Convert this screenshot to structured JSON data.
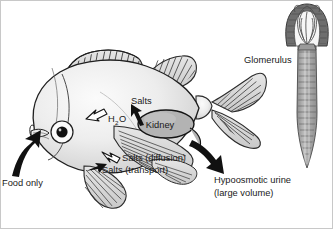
{
  "figure": {
    "background_color": "#ffffff",
    "border_color": "#b4b4b4",
    "ink_color": "#1a1a1a"
  },
  "labels": {
    "food_only": "Food only",
    "h2o": "H",
    "h2o_sub": "2",
    "h2o_o": "O",
    "salts": "Salts",
    "salts_diffusion": "Salts (diffusion)",
    "salts_transport": "Salts (transport)",
    "kidney": "Kidney",
    "urine_line1": "Hypoosmotic urine",
    "urine_line2": "(large volume)",
    "glomerulus": "Glomerulus"
  },
  "arrows": {
    "food_arrow": {
      "style": "solid-black",
      "direction": "into-mouth",
      "meaning": "Food only intake"
    },
    "h2o_arrow": {
      "style": "white-outline",
      "direction": "inward",
      "meaning": "Water uptake across body surface"
    },
    "salts_arrow": {
      "style": "solid-black",
      "direction": "up-to-kidney",
      "meaning": "Salts to kidney"
    },
    "salts_diffusion_arrow": {
      "style": "white-outline",
      "direction": "outward",
      "meaning": "Salt loss by diffusion"
    },
    "salts_transport_arrow": {
      "style": "solid-black",
      "direction": "inward",
      "meaning": "Salt uptake by active transport"
    },
    "urine_arrow": {
      "style": "solid-black",
      "direction": "out-posterior",
      "meaning": "Hypoosmotic urine excretion"
    }
  },
  "colors": {
    "body_light": "#f2f2f2",
    "body_mid": "#d9d9d9",
    "body_shade": "#c2c2c2",
    "fin_fill": "#dcdcdc",
    "fin_line": "#4d4d4d",
    "kidney_fill": "#b0b0b0",
    "kidney_line": "#1a1a1a",
    "glomerulus_dark": "#6e6e6e",
    "glomerulus_mid": "#9a9a9a",
    "glomerulus_light": "#f4f4f4",
    "tubule_fill": "#a8a8a8",
    "ink": "#1a1a1a"
  },
  "anatomy": {
    "fish": {
      "parts": [
        "body",
        "eye",
        "mouth",
        "operculum",
        "spiny-dorsal-fin",
        "soft-dorsal-fin",
        "pectoral-fin",
        "pelvic-fin",
        "anal-fin",
        "caudal-fin",
        "kidney"
      ]
    },
    "nephron": {
      "parts": [
        "bowmans-capsule",
        "glomerular-capillary-tuft",
        "renal-tubule",
        "collecting-duct"
      ]
    }
  }
}
